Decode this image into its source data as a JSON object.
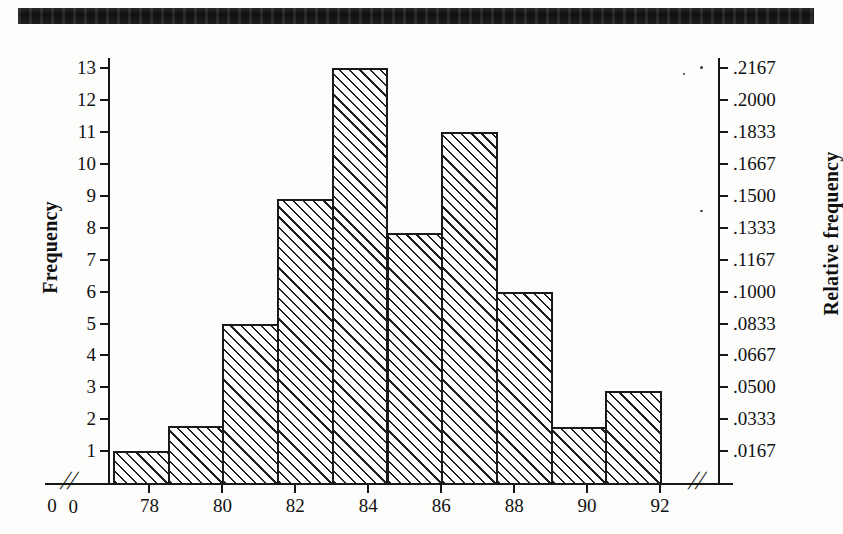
{
  "figure": {
    "title_bar": "",
    "caption": ""
  },
  "chart_data": {
    "type": "bar",
    "title": "",
    "subtitle": "",
    "xlabel": "",
    "ylabel": "Frequency",
    "y2label": "Relative frequency",
    "grid": false,
    "legend": "none",
    "sample_size": 60,
    "class_width": 1.5,
    "xlim": [
      77,
      92
    ],
    "ylim": [
      0,
      13
    ],
    "y2lim": [
      0,
      0.2167
    ],
    "x_axis_break": true,
    "categories": [
      "77.0-78.5",
      "78.5-80.0",
      "80.0-81.5",
      "81.5-83.0",
      "83.0-84.5",
      "84.5-86.0",
      "86.0-87.5",
      "87.5-89.0",
      "89.0-90.5",
      "90.5-92.0"
    ],
    "bin_edges": [
      77,
      78.5,
      80,
      81.5,
      83,
      84.5,
      86,
      87.5,
      89,
      90.5,
      92
    ],
    "values": [
      1,
      1.8,
      5,
      8.9,
      13,
      7.85,
      11,
      6,
      1.75,
      2.9
    ],
    "relative_values": [
      0.0167,
      0.03,
      0.0833,
      0.1483,
      0.2167,
      0.1308,
      0.1833,
      0.1,
      0.0292,
      0.0483
    ],
    "xticks": [
      "0",
      "78",
      "80",
      "82",
      "84",
      "86",
      "88",
      "90",
      "92"
    ],
    "xtick_values": [
      0,
      78,
      80,
      82,
      84,
      86,
      88,
      90,
      92
    ],
    "yticks": [
      "1",
      "2",
      "3",
      "4",
      "5",
      "6",
      "7",
      "8",
      "9",
      "10",
      "11",
      "12",
      "13"
    ],
    "ytick_values": [
      1,
      2,
      3,
      4,
      5,
      6,
      7,
      8,
      9,
      10,
      11,
      12,
      13
    ],
    "y2ticks": [
      ".0167",
      ".0333",
      ".0500",
      ".0667",
      ".0833",
      ".1000",
      ".1167",
      ".1333",
      ".1500",
      ".1667",
      ".1833",
      ".2000",
      ".2167"
    ],
    "y2tick_values": [
      0.0167,
      0.0333,
      0.05,
      0.0667,
      0.0833,
      0.1,
      0.1167,
      0.1333,
      0.15,
      0.1667,
      0.1833,
      0.2,
      0.2167
    ],
    "origin_label": "0",
    "break_marks": [
      "//",
      "//"
    ],
    "colors": {
      "bar_fill": "#ffffff",
      "bar_hatch": "#1f1f1f",
      "bar_border": "#1a1a1a",
      "axis": "#161616",
      "text": "#111111",
      "page_background": "#fdfdfc",
      "header_bar": "#141414"
    }
  }
}
